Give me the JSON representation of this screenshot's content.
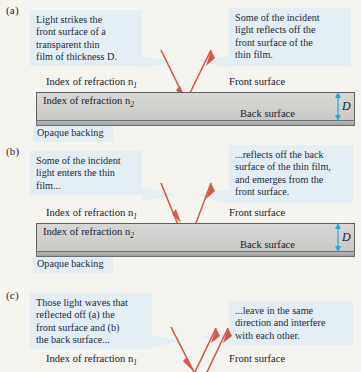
{
  "figure": {
    "background_color": "#f6f4ef",
    "ray_color": "#d8554a",
    "callout_color": "#e3eef4",
    "dimension_color": "#29a8d8",
    "film_color": "#cfcfcc"
  },
  "panels": [
    {
      "label": "(a)",
      "callout_left": "Light strikes the front surface of a transparent thin film of thickness D.",
      "callout_left_lines": [
        "Light strikes the",
        "front surface of a",
        "transparent thin",
        "film of thickness D."
      ],
      "callout_right": "Some of the incident light reflects off the front surface of the thin film.",
      "callout_right_lines": [
        "Some of the incident",
        "light reflects off the",
        "front surface of the",
        "thin film."
      ],
      "label_n1": "Index of refraction n",
      "sub_n1": "1",
      "label_n2": "Index of refraction n",
      "sub_n2": "2",
      "label_front": "Front surface",
      "label_back": "Back surface",
      "label_backing": "Opaque backing",
      "dimension": "D"
    },
    {
      "label": "(b)",
      "callout_left": "Some of the incident light enters the thin film...",
      "callout_left_lines": [
        "Some of the incident",
        "light enters the thin",
        "film..."
      ],
      "callout_right": "...reflects off the back surface of the thin film, and emerges from the front surface.",
      "callout_right_lines": [
        "...reflects off the back",
        "surface of the thin film,",
        "and emerges from the",
        "front surface."
      ],
      "label_n1": "Index of refraction n",
      "sub_n1": "1",
      "label_n2": "Index of refraction n",
      "sub_n2": "2",
      "label_front": "Front surface",
      "label_back": "Back surface",
      "label_backing": "Opaque backing",
      "dimension": "D"
    },
    {
      "label": "(c)",
      "callout_left": "Those light waves that reflected off (a) the front surface and (b) the back surface...",
      "callout_left_lines": [
        "Those light waves that",
        "reflected off (a) the",
        "front surface and (b)",
        "the back surface..."
      ],
      "callout_right": "...leave in the same direction and interfere with each other.",
      "callout_right_lines": [
        "...leave in the same",
        "direction and interfere",
        "with each other."
      ],
      "label_n1": "Index of refraction n",
      "sub_n1": "1",
      "label_front": "Front surface"
    }
  ]
}
